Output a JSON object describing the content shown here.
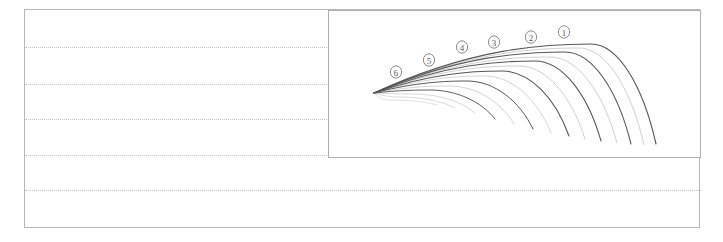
{
  "page": {
    "background_color": "#ffffff",
    "frame": {
      "border_color": "#b7b7b7",
      "x": 24,
      "y": 9,
      "width": 676,
      "height": 219
    },
    "ruled_lines": {
      "color": "#c3c3c8",
      "style": "dotted",
      "y_positions": [
        47,
        84,
        119,
        155,
        190
      ],
      "widths": [
        676,
        676,
        676,
        676,
        676
      ]
    }
  },
  "chart_panel": {
    "border_color": "#b0b0b0",
    "x": 328,
    "y": 10,
    "width": 373,
    "height": 148
  },
  "chart_data": {
    "type": "line",
    "title": "",
    "subtitle": "",
    "xlabel": "",
    "ylabel": "",
    "xlim": [
      0,
      373
    ],
    "ylim": [
      148,
      0
    ],
    "grid": false,
    "legend_position": "inline-annotations",
    "axis_ticks_visible": false,
    "origin": {
      "x": 45,
      "y": 82
    },
    "stroke_color": "#4a4a4a",
    "minor_stroke_color": "#7d7d7d",
    "series": [
      {
        "name": "1",
        "label": "①",
        "marker_shape": "circled-number",
        "label_x": 235,
        "label_y": 21,
        "apex": {
          "x": 262,
          "y": 33
        },
        "end": {
          "x": 327,
          "y": 133
        },
        "stroke_width": 1.15,
        "major": true
      },
      {
        "name": "1b",
        "label": "",
        "apex": {
          "x": 250,
          "y": 37
        },
        "end": {
          "x": 315,
          "y": 134
        },
        "stroke_width": 0.65,
        "major": false
      },
      {
        "name": "2",
        "label": "②",
        "marker_shape": "circled-number",
        "label_x": 202,
        "label_y": 26,
        "apex": {
          "x": 236,
          "y": 41
        },
        "end": {
          "x": 302,
          "y": 133
        },
        "stroke_width": 1.1,
        "major": true
      },
      {
        "name": "2b",
        "label": "",
        "apex": {
          "x": 221,
          "y": 46
        },
        "end": {
          "x": 288,
          "y": 132
        },
        "stroke_width": 0.65,
        "major": false
      },
      {
        "name": "3",
        "label": "③",
        "marker_shape": "circled-number",
        "label_x": 165,
        "label_y": 31,
        "apex": {
          "x": 206,
          "y": 50
        },
        "end": {
          "x": 272,
          "y": 130
        },
        "stroke_width": 1.1,
        "major": true
      },
      {
        "name": "3b",
        "label": "",
        "apex": {
          "x": 190,
          "y": 55
        },
        "end": {
          "x": 256,
          "y": 128
        },
        "stroke_width": 0.65,
        "major": false
      },
      {
        "name": "4",
        "label": "④",
        "marker_shape": "circled-number",
        "label_x": 133,
        "label_y": 36,
        "apex": {
          "x": 173,
          "y": 60
        },
        "end": {
          "x": 240,
          "y": 125
        },
        "stroke_width": 1.05,
        "major": true
      },
      {
        "name": "4b",
        "label": "",
        "apex": {
          "x": 156,
          "y": 65
        },
        "end": {
          "x": 222,
          "y": 122
        },
        "stroke_width": 0.6,
        "major": false
      },
      {
        "name": "5",
        "label": "⑤",
        "marker_shape": "circled-number",
        "label_x": 100,
        "label_y": 49,
        "apex": {
          "x": 138,
          "y": 70
        },
        "end": {
          "x": 204,
          "y": 118
        },
        "stroke_width": 1.0,
        "major": true
      },
      {
        "name": "5b",
        "label": "",
        "apex": {
          "x": 120,
          "y": 75
        },
        "end": {
          "x": 185,
          "y": 113
        },
        "stroke_width": 0.6,
        "major": false
      },
      {
        "name": "6",
        "label": "⑥",
        "marker_shape": "circled-number",
        "label_x": 67,
        "label_y": 61,
        "apex": {
          "x": 101,
          "y": 79
        },
        "end": {
          "x": 166,
          "y": 108
        },
        "stroke_width": 0.95,
        "major": true
      },
      {
        "name": "6b",
        "label": "",
        "apex": {
          "x": 84,
          "y": 83
        },
        "end": {
          "x": 146,
          "y": 102
        },
        "stroke_width": 0.55,
        "major": false
      },
      {
        "name": "7",
        "label": "",
        "apex": {
          "x": 70,
          "y": 86
        },
        "end": {
          "x": 126,
          "y": 97
        },
        "stroke_width": 0.5,
        "major": false
      },
      {
        "name": "8",
        "label": "",
        "apex": {
          "x": 60,
          "y": 89
        },
        "end": {
          "x": 108,
          "y": 94
        },
        "stroke_width": 0.45,
        "major": false
      }
    ],
    "annotations": [
      {
        "text": "①",
        "x": 235,
        "y": 21
      },
      {
        "text": "②",
        "x": 202,
        "y": 26
      },
      {
        "text": "③",
        "x": 165,
        "y": 31
      },
      {
        "text": "④",
        "x": 133,
        "y": 36
      },
      {
        "text": "⑤",
        "x": 100,
        "y": 49
      },
      {
        "text": "⑥",
        "x": 67,
        "y": 61
      }
    ]
  }
}
